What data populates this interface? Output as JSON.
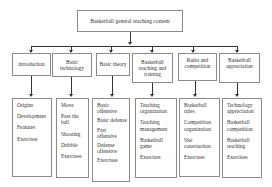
{
  "diagram": {
    "title": "Basketball general teaching content",
    "categories": [
      {
        "label": "introduction",
        "items": [
          "Origins",
          "Development",
          "Features",
          "Exercises"
        ]
      },
      {
        "label": "Basic technology",
        "items": [
          "Move",
          "Pass the ball",
          "Shooting",
          "Dribble",
          "Exercises"
        ]
      },
      {
        "label": "Basic theory",
        "items": [
          "Basic offensive",
          "Basic defense",
          "Fast offensive",
          "Defense offensive",
          "Exercises"
        ]
      },
      {
        "label": "Basketball teaching and training",
        "items": [
          "Teaching organization",
          "Teaching management",
          "Basketball game",
          "Exercises"
        ]
      },
      {
        "label": "Rules and competition",
        "items": [
          "Basketball rules",
          "Competition organization",
          "Site construction",
          "Exercises"
        ]
      },
      {
        "label": "Basketball appreciation",
        "items": [
          "Technology appreciation",
          "Basketball competition",
          "Basketball teaching",
          "Exercises"
        ]
      }
    ]
  }
}
